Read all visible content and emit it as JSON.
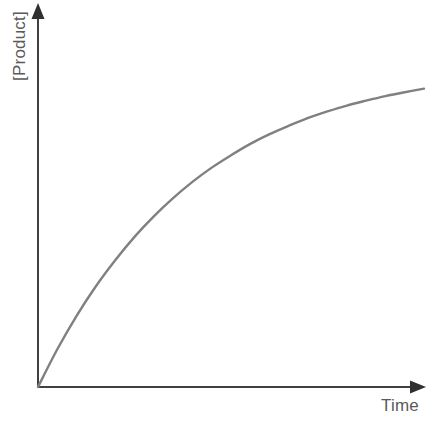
{
  "chart_data": {
    "type": "line",
    "title": "",
    "subtitle": "",
    "xlabel": "Time",
    "ylabel": "[Product]",
    "xlim": [
      0,
      1
    ],
    "ylim": [
      0,
      1
    ],
    "grid": false,
    "legend": null,
    "axis_style": {
      "arrowheads": true,
      "ticks": false,
      "tick_labels": false
    },
    "annotations": [],
    "series": [
      {
        "name": "[Product]",
        "description": "Product concentration rising and saturating over time",
        "color": "#808080",
        "x": [
          0.0,
          0.05,
          0.1,
          0.15,
          0.2,
          0.25,
          0.3,
          0.35,
          0.4,
          0.45,
          0.5,
          0.55,
          0.6,
          0.65,
          0.7,
          0.75,
          0.8,
          0.85,
          0.9,
          0.95,
          1.0
        ],
        "y": [
          0.0,
          0.116,
          0.219,
          0.31,
          0.39,
          0.462,
          0.525,
          0.581,
          0.631,
          0.675,
          0.713,
          0.748,
          0.778,
          0.804,
          0.828,
          0.848,
          0.866,
          0.881,
          0.895,
          0.907,
          0.918
        ]
      }
    ],
    "colors": {
      "background": "#ffffff",
      "axis": "#404040",
      "curve": "#808080",
      "label_text": "#5a5a5a"
    }
  },
  "labels": {
    "y_axis": "[Product]",
    "x_axis": "Time"
  }
}
